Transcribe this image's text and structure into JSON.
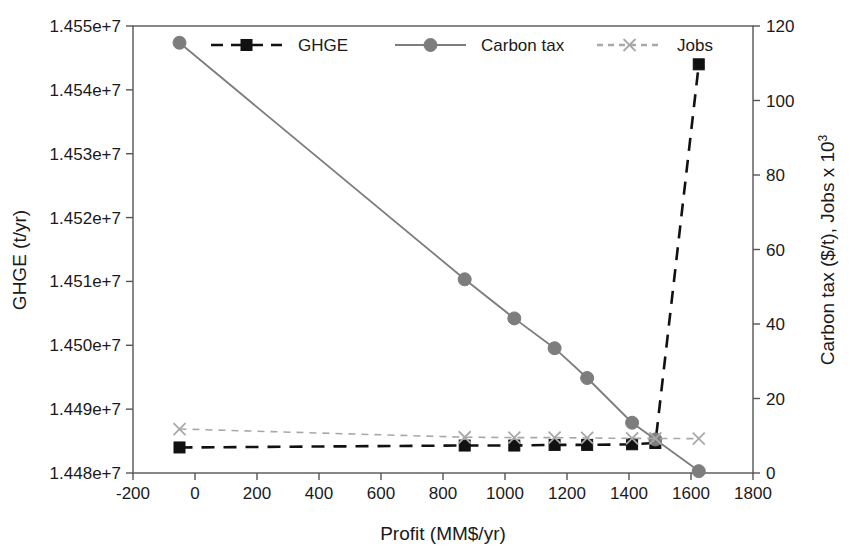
{
  "figure": {
    "width": 855,
    "height": 559,
    "background": "#ffffff"
  },
  "chart_data": {
    "type": "line",
    "title": "",
    "xlabel": "Profit (MM$/yr)",
    "ylabel": "GHGE (t/yr)",
    "y2label_main": "Carbon tax ($/t), Jobs x 10",
    "y2label_sup": "3",
    "grid": false,
    "legend_position": "top-inside",
    "xlim": [
      -200,
      1800
    ],
    "xticks": [
      -200,
      0,
      200,
      400,
      600,
      800,
      1000,
      1200,
      1400,
      1600,
      1800
    ],
    "xticklabels": [
      "-200",
      "0",
      "200",
      "400",
      "600",
      "800",
      "1000",
      "1200",
      "1400",
      "1600",
      "1800"
    ],
    "ylim": [
      14480000,
      14550000
    ],
    "yticks": [
      14480000,
      14490000,
      14500000,
      14510000,
      14520000,
      14530000,
      14540000,
      14550000
    ],
    "yticklabels": [
      "1.448e+7",
      "1.449e+7",
      "1.450e+7",
      "1.451e+7",
      "1.452e+7",
      "1.453e+7",
      "1.454e+7",
      "1.455e+7"
    ],
    "y2lim": [
      0,
      120
    ],
    "y2ticks": [
      0,
      20,
      40,
      60,
      80,
      100,
      120
    ],
    "y2ticklabels": [
      "0",
      "20",
      "40",
      "60",
      "80",
      "100",
      "120"
    ],
    "series": [
      {
        "name": "GHGE",
        "axis": "left",
        "color": "#111111",
        "marker": "square",
        "linestyle": "dashed",
        "x": [
          -50,
          870,
          1030,
          1160,
          1265,
          1410,
          1485,
          1625
        ],
        "y": [
          14484000,
          14484300,
          14484300,
          14484400,
          14484400,
          14484500,
          14484700,
          14544000
        ]
      },
      {
        "name": "Carbon tax",
        "axis": "right",
        "color": "#7d7d7d",
        "marker": "circle",
        "linestyle": "solid",
        "x": [
          -50,
          870,
          1030,
          1160,
          1265,
          1410,
          1485,
          1625
        ],
        "y": [
          115.5,
          52.0,
          41.5,
          33.5,
          25.5,
          13.5,
          9.0,
          0.5
        ]
      },
      {
        "name": "Jobs",
        "axis": "right",
        "color": "#a8a8a8",
        "marker": "cross",
        "linestyle": "dashed",
        "x": [
          -50,
          870,
          1030,
          1160,
          1265,
          1410,
          1485,
          1625
        ],
        "y": [
          11.8,
          9.6,
          9.5,
          9.5,
          9.4,
          9.3,
          9.3,
          9.2
        ]
      }
    ]
  },
  "legend": {
    "entries": [
      {
        "label": "GHGE",
        "color": "#111111",
        "marker": "square",
        "linestyle": "dashed"
      },
      {
        "label": "Carbon tax",
        "color": "#7d7d7d",
        "marker": "circle",
        "linestyle": "solid"
      },
      {
        "label": "Jobs",
        "color": "#a8a8a8",
        "marker": "cross",
        "linestyle": "dashed"
      }
    ]
  }
}
